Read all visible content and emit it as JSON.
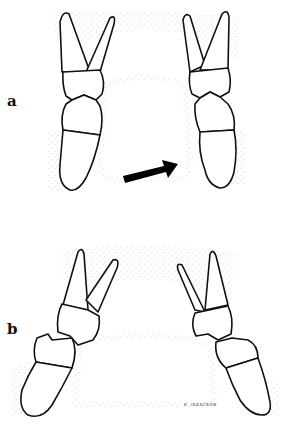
{
  "figure": {
    "panels": [
      {
        "id": "a",
        "label": "a",
        "annotation": "arrow pointing right toward right posterior tooth"
      },
      {
        "id": "b",
        "label": "b"
      }
    ],
    "signature": "K. ISAACSON",
    "colors": {
      "line": "#111111",
      "stipple": "#9a9a9a",
      "arrow": "#000000",
      "background": "#ffffff"
    }
  }
}
